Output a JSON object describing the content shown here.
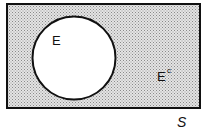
{
  "diagram": {
    "type": "venn",
    "universe_label": "S",
    "set_label": "E",
    "complement_label": "E",
    "complement_superscript": "c",
    "colors": {
      "shade": "#c8c8c8",
      "stroke": "#111111",
      "set_fill": "#ffffff"
    }
  }
}
